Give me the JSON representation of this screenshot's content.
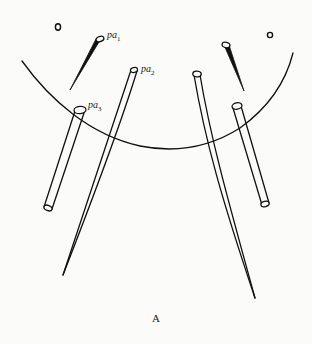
{
  "figure": {
    "caption": "A",
    "labels": [
      {
        "id": "pa1",
        "base": "pa",
        "sub": "1"
      },
      {
        "id": "pa2",
        "base": "pa",
        "sub": "2"
      },
      {
        "id": "pa3",
        "base": "pa",
        "sub": "3"
      }
    ],
    "colors": {
      "ink": "#111111",
      "paper": "#fbfbf9"
    }
  }
}
